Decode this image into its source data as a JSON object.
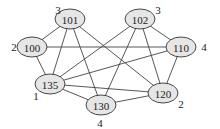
{
  "graph": {
    "nodes": [
      {
        "id": "101",
        "label": "101",
        "x": 70,
        "y": 19,
        "weight": "3",
        "wx": 58,
        "wy": 10
      },
      {
        "id": "102",
        "label": "102",
        "x": 140,
        "y": 19,
        "weight": "3",
        "wx": 158,
        "wy": 10
      },
      {
        "id": "100",
        "label": "100",
        "x": 32,
        "y": 47,
        "weight": "2",
        "wx": 14,
        "wy": 47
      },
      {
        "id": "110",
        "label": "110",
        "x": 181,
        "y": 47,
        "weight": "4",
        "wx": 204,
        "wy": 47
      },
      {
        "id": "135",
        "label": "135",
        "x": 50,
        "y": 84,
        "weight": "1",
        "wx": 36,
        "wy": 96
      },
      {
        "id": "130",
        "label": "130",
        "x": 101,
        "y": 105,
        "weight": "4",
        "wx": 100,
        "wy": 123
      },
      {
        "id": "120",
        "label": "120",
        "x": 163,
        "y": 93,
        "weight": "2",
        "wx": 181,
        "wy": 104
      }
    ],
    "edges": [
      [
        "101",
        "100"
      ],
      [
        "101",
        "135"
      ],
      [
        "101",
        "130"
      ],
      [
        "101",
        "120"
      ],
      [
        "102",
        "110"
      ],
      [
        "102",
        "135"
      ],
      [
        "102",
        "130"
      ],
      [
        "102",
        "120"
      ],
      [
        "100",
        "110"
      ],
      [
        "100",
        "135"
      ],
      [
        "110",
        "135"
      ],
      [
        "110",
        "120"
      ],
      [
        "135",
        "130"
      ],
      [
        "135",
        "120"
      ],
      [
        "130",
        "120"
      ]
    ],
    "node_rx": 15,
    "node_ry": 10,
    "colors": {
      "node_fill": "#e6e6e6",
      "stroke": "#333333",
      "edge": "#444444"
    }
  }
}
